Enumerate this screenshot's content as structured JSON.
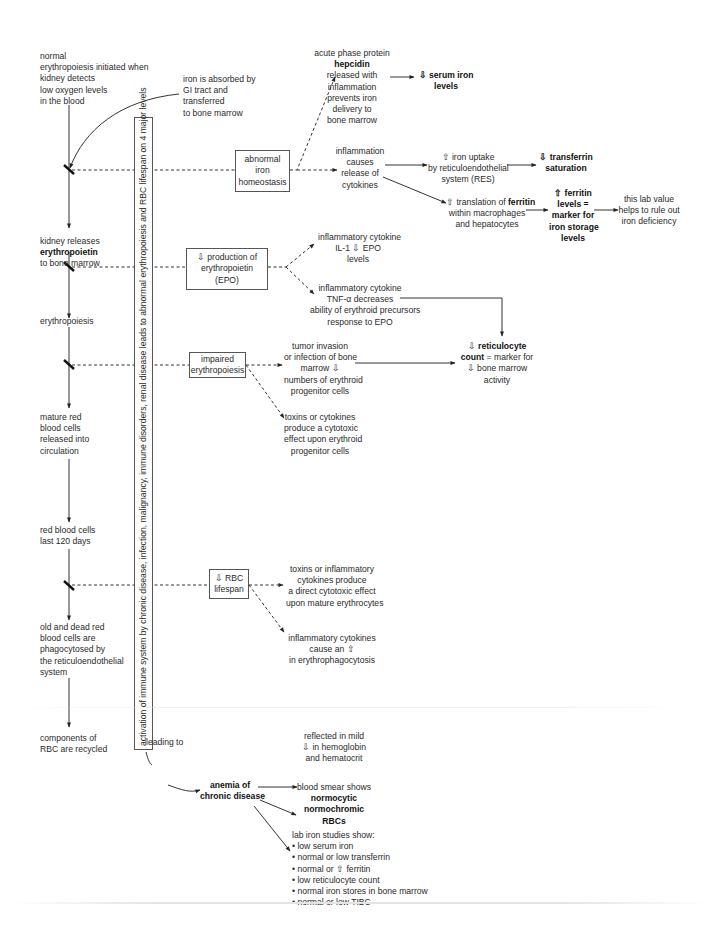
{
  "main_flow": {
    "step1": [
      "normal",
      "erythropoiesis initiated when",
      "kidney detects",
      "low oxygen levels",
      "in the blood"
    ],
    "step2_pre": "kidney releases",
    "step2_bold": "erythropoietin",
    "step2_post": "to bone marrow",
    "step3": "erythropoiesis",
    "step4": [
      "mature red",
      "blood cells",
      "released into",
      "circulation"
    ],
    "step5": [
      "red blood cells",
      "last 120 days"
    ],
    "step6": [
      "old and dead red",
      "blood cells are",
      "phagocytosed by",
      "the reticuloendothelial",
      "system"
    ],
    "step7": [
      "components of",
      "RBC are recycled"
    ]
  },
  "iron_absorption": [
    "iron is absorbed by",
    "GI tract and",
    "transferred",
    "to bone marrow"
  ],
  "vertical_banner": "activation of immune system by chronic disease, infection, malignancy, immune disorders, renal disease leads to abnormal erythropoiesis and RBC lifespan on 4 major levels",
  "levels": {
    "iron_homeostasis": [
      "abnormal",
      "iron",
      "homeostasis"
    ],
    "epo_production": [
      "⇩ production of",
      "erythropoietin",
      "(EPO)"
    ],
    "impaired_erythropoiesis": [
      "impaired",
      "erythropoiesis"
    ],
    "rbc_lifespan": [
      "⇩ RBC",
      "lifespan"
    ]
  },
  "iron": {
    "hepcidin_pre": "acute phase protein",
    "hepcidin_bold": "hepcidin",
    "hepcidin_post": [
      "released with",
      "inflammation",
      "prevents iron",
      "delivery to",
      "bone marrow"
    ],
    "serum_iron": [
      "⇩ serum iron",
      "levels"
    ],
    "inflammation": [
      "inflammation",
      "causes",
      "release of",
      "cytokines"
    ],
    "iron_uptake": [
      "⇧ iron uptake",
      "by reticuloendothelial",
      "system (RES)"
    ],
    "transferrin": [
      "⇩ transferrin",
      "saturation"
    ],
    "ferritin_translation_pre": "⇧ translation of",
    "ferritin_translation_bold": "ferritin",
    "ferritin_translation_post": [
      "within macrophages",
      "and hepatocytes"
    ],
    "ferritin_levels": [
      "⇧ ferritin",
      "levels =",
      "marker for",
      "iron storage",
      "levels"
    ],
    "lab_value": [
      "this lab value",
      "helps to rule out",
      "iron deficiency"
    ]
  },
  "epo": {
    "il1": [
      "inflammatory cytokine",
      "IL-1 ⇩ EPO",
      "levels"
    ],
    "tnf": [
      "inflammatory cytokine",
      "TNF-α decreases",
      "ability of erythroid precursors",
      "response to EPO"
    ]
  },
  "erythropoiesis": {
    "tumor": [
      "tumor invasion",
      "or infection of bone",
      "marrow ⇩",
      "numbers of erythroid",
      "progenitor cells"
    ],
    "toxins": [
      "toxins or cytokines",
      "produce a cytotoxic",
      "effect upon erythroid",
      "progenitor cells"
    ],
    "retic_line1_pre": "⇩ ",
    "retic_line1_bold": "reticulocyte",
    "retic_line2_bold": "count",
    "retic_line2_post": " = marker for",
    "retic_rest": [
      "⇩ bone marrow",
      "activity"
    ]
  },
  "lifespan": {
    "direct": [
      "toxins or inflammatory",
      "cytokines produce",
      "a direct cytotoxic effect",
      "upon mature erythrocytes"
    ],
    "phago": [
      "inflammatory cytokines",
      "cause an ⇧",
      "in erythrophagocytosis"
    ]
  },
  "outcome": {
    "leading_to": "leading to",
    "anemia": [
      "anemia of",
      "chronic disease"
    ],
    "reflected": [
      "reflected in mild",
      "⇩ in hemoglobin",
      "and hematocrit"
    ],
    "smear_pre": "blood smear shows",
    "smear_bold": [
      "normocytic",
      "normochromic",
      "RBCs"
    ],
    "lab_title": "lab iron studies show:",
    "lab_items": [
      "• low serum iron",
      "• normal or low transferrin",
      "• normal or ⇧ ferritin",
      "• low reticulocyte count",
      "• normal iron stores in bone marrow",
      "• normal or low TIBC"
    ]
  }
}
